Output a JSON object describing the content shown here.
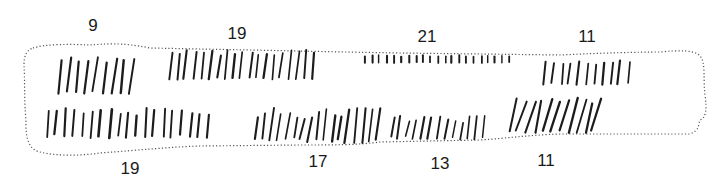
{
  "figure": {
    "colors": {
      "ink": "#1c1c1c",
      "outline": "#555555",
      "background": "#ffffff"
    }
  },
  "labels": {
    "top": [
      {
        "value": "9",
        "x": 93,
        "y": 17
      },
      {
        "value": "19",
        "x": 237,
        "y": 25
      },
      {
        "value": "21",
        "x": 427,
        "y": 28
      },
      {
        "value": "11",
        "x": 587,
        "y": 28
      }
    ],
    "bottom": [
      {
        "value": "19",
        "x": 130,
        "y": 160
      },
      {
        "value": "17",
        "x": 318,
        "y": 153
      },
      {
        "value": "13",
        "x": 440,
        "y": 155
      },
      {
        "value": "11",
        "x": 546,
        "y": 152
      }
    ]
  },
  "outline_path": "M33,48 C45,44 70,44 90,45 C105,44 120,42 150,48 L250,50 C300,51 340,52 400,53 L560,55 C600,53 640,52 660,52 C680,50 695,50 700,56 C706,62 703,80 705,95 C707,110 706,118 700,120 C698,125 700,130 690,134 L560,134 C530,135 510,138 480,140 L380,142 C360,145 330,145 300,145 L200,146 C170,147 140,150 100,153 C80,156 55,156 40,152 C30,150 25,140 26,120 C24,100 25,80 24,65 C24,55 27,50 33,48 Z",
  "notch_groups": [
    {
      "name": "top-9",
      "count": 9,
      "x_start": 60,
      "x_end": 132,
      "y_top": 57,
      "y_bottom": 94,
      "slant": 4,
      "width": 2.2,
      "variance": 6
    },
    {
      "name": "top-19",
      "count": 19,
      "x_start": 170,
      "x_end": 314,
      "y_top": 50,
      "y_bottom": 80,
      "slant": 3,
      "width": 2.0,
      "variance": 6
    },
    {
      "name": "top-21",
      "count": 21,
      "x_start": 365,
      "x_end": 510,
      "y_top": 55,
      "y_bottom": 63,
      "slant": 0,
      "width": 1.8,
      "variance": 2
    },
    {
      "name": "top-11",
      "count": 11,
      "x_start": 545,
      "x_end": 628,
      "y_top": 60,
      "y_bottom": 85,
      "slant": 2,
      "width": 2.0,
      "variance": 5
    },
    {
      "name": "bottom-19",
      "count": 19,
      "x_start": 47,
      "x_end": 208,
      "y_top": 108,
      "y_bottom": 138,
      "slant": 2,
      "width": 2.2,
      "variance": 8
    },
    {
      "name": "bottom-17",
      "count": 17,
      "x_start": 257,
      "x_end": 378,
      "y_top": 108,
      "y_bottom": 143,
      "slant": 4,
      "width": 2.0,
      "variance": 12
    },
    {
      "name": "bottom-13",
      "count": 13,
      "x_start": 392,
      "x_end": 484,
      "y_top": 115,
      "y_bottom": 140,
      "slant": 3,
      "width": 1.8,
      "variance": 8
    },
    {
      "name": "bottom-11",
      "count": 11,
      "x_start": 514,
      "x_end": 597,
      "y_top": 98,
      "y_bottom": 133,
      "slant": 8,
      "width": 2.0,
      "variance": 6
    }
  ]
}
